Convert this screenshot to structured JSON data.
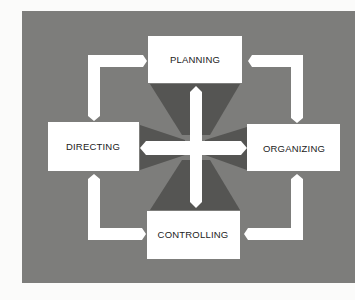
{
  "diagram": {
    "colors": {
      "page": "#fbfbfa",
      "panel": "#7d7d7b",
      "wedge": "#555553",
      "box": "#ffffff",
      "connector": "#ffffff",
      "text": "#222222"
    },
    "nodes": {
      "planning": {
        "label": "PLANNING"
      },
      "organizing": {
        "label": "ORGANIZING"
      },
      "controlling": {
        "label": "CONTROLLING"
      },
      "directing": {
        "label": "DIRECTING"
      }
    },
    "edges": [
      {
        "from": "planning",
        "to": "organizing",
        "type": "bidirectional"
      },
      {
        "from": "organizing",
        "to": "controlling",
        "type": "bidirectional"
      },
      {
        "from": "controlling",
        "to": "directing",
        "type": "bidirectional"
      },
      {
        "from": "directing",
        "to": "planning",
        "type": "bidirectional"
      },
      {
        "from": "planning",
        "to": "controlling",
        "type": "bidirectional"
      },
      {
        "from": "directing",
        "to": "organizing",
        "type": "bidirectional"
      }
    ]
  }
}
